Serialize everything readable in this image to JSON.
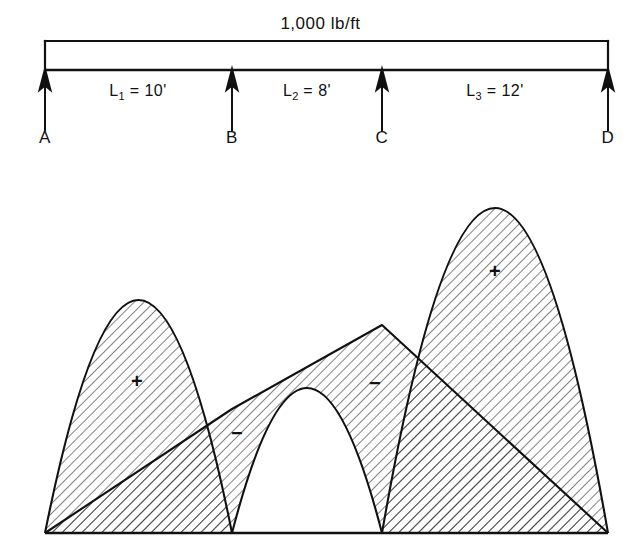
{
  "figure": {
    "type": "bending-moment-diagram",
    "title_visible": false
  },
  "beam": {
    "load_label": "1,000 lb/ft",
    "supports": [
      {
        "id": "A",
        "label": "A",
        "x": 45
      },
      {
        "id": "B",
        "label": "B",
        "x": 232
      },
      {
        "id": "C",
        "label": "C",
        "x": 382
      },
      {
        "id": "D",
        "label": "D",
        "x": 608
      }
    ],
    "spans": [
      {
        "id": "L1",
        "label": "L",
        "subscript": "1",
        "value": "10'",
        "text": "L1 = 10'",
        "center_x": 138
      },
      {
        "id": "L2",
        "label": "L",
        "subscript": "2",
        "value": "8'",
        "text": "L2 = 8'",
        "center_x": 307
      },
      {
        "id": "L3",
        "label": "L",
        "subscript": "3",
        "value": "12'",
        "text": "L3 = 12'",
        "center_x": 495
      }
    ]
  },
  "moment_diagram": {
    "baseline_y": 533,
    "region_signs": [
      {
        "sign": "+",
        "span": "L1",
        "x": 139,
        "y": 382
      },
      {
        "sign": "−",
        "span": "L2",
        "x": 237,
        "y": 433
      },
      {
        "sign": "−",
        "span": "L2",
        "x": 375,
        "y": 383
      },
      {
        "sign": "+",
        "span": "L3",
        "x": 497,
        "y": 272
      }
    ]
  },
  "chart_data": {
    "type": "area",
    "xlabel": "",
    "ylabel": "Bending moment",
    "grid": false,
    "legend": "none",
    "uniform_load": "1,000 lb/ft",
    "supports": [
      "A",
      "B",
      "C",
      "D"
    ],
    "support_x_px": [
      45,
      232,
      382,
      608
    ],
    "span_lengths_ft": [
      10,
      8,
      12
    ],
    "span_labels": [
      "L1 = 10'",
      "L2 = 8'",
      "L3 = 12'"
    ],
    "baseline_y_px": 533,
    "series": [
      {
        "name": "simple-beam parabola span 1",
        "type": "parabola",
        "x_start_px": 45,
        "x_end_px": 232,
        "apex_x_px": 138,
        "apex_y_px": 300,
        "peak_height_px": 233
      },
      {
        "name": "simple-beam parabola span 2",
        "type": "parabola",
        "x_start_px": 232,
        "x_end_px": 382,
        "apex_x_px": 307,
        "apex_y_px": 388,
        "peak_height_px": 145
      },
      {
        "name": "simple-beam parabola span 3",
        "type": "parabola",
        "x_start_px": 382,
        "x_end_px": 608,
        "apex_x_px": 495,
        "apex_y_px": 208,
        "peak_height_px": 325
      },
      {
        "name": "negative moment chord line",
        "type": "line",
        "points_px": [
          [
            45,
            533
          ],
          [
            232,
            409
          ],
          [
            382,
            325
          ],
          [
            608,
            533
          ]
        ],
        "support_moment_px": [
          0,
          124,
          208,
          0
        ]
      }
    ],
    "annotations": [
      {
        "text": "+",
        "x_px": 139,
        "y_px": 382,
        "meaning": "positive moment area span 1"
      },
      {
        "text": "-",
        "x_px": 237,
        "y_px": 433,
        "meaning": "negative moment area near B"
      },
      {
        "text": "-",
        "x_px": 375,
        "y_px": 383,
        "meaning": "negative moment area near C"
      },
      {
        "text": "+",
        "x_px": 497,
        "y_px": 272,
        "meaning": "positive moment area span 3"
      }
    ]
  }
}
